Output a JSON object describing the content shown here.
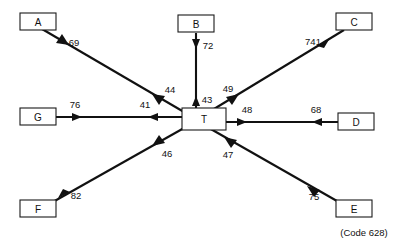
{
  "diagram": {
    "type": "hub-and-spoke-flow",
    "center_node": {
      "id": "T",
      "label": "T"
    },
    "nodes": [
      {
        "id": "A",
        "label": "A"
      },
      {
        "id": "B",
        "label": "B"
      },
      {
        "id": "C",
        "label": "C"
      },
      {
        "id": "D",
        "label": "D"
      },
      {
        "id": "E",
        "label": "E"
      },
      {
        "id": "F",
        "label": "F"
      },
      {
        "id": "G",
        "label": "G"
      }
    ],
    "flows": [
      {
        "id": "a-in",
        "from": "A",
        "to": "T",
        "value": "69"
      },
      {
        "id": "a-out",
        "from": "T",
        "to": "A",
        "value": "44"
      },
      {
        "id": "b-in",
        "from": "B",
        "to": "T",
        "value": "72"
      },
      {
        "id": "b-out",
        "from": "T",
        "to": "B",
        "value": "43"
      },
      {
        "id": "c-in",
        "from": "C",
        "to": "T",
        "value": "741"
      },
      {
        "id": "c-out",
        "from": "T",
        "to": "C",
        "value": "49"
      },
      {
        "id": "d-in",
        "from": "D",
        "to": "T",
        "value": "68"
      },
      {
        "id": "d-out",
        "from": "T",
        "to": "D",
        "value": "48"
      },
      {
        "id": "e-in",
        "from": "E",
        "to": "T",
        "value": "75"
      },
      {
        "id": "e-out",
        "from": "T",
        "to": "E",
        "value": "47"
      },
      {
        "id": "f-in",
        "from": "F",
        "to": "T",
        "value": "82"
      },
      {
        "id": "f-out",
        "from": "T",
        "to": "F",
        "value": "46"
      },
      {
        "id": "g-in",
        "from": "G",
        "to": "T",
        "value": "76"
      },
      {
        "id": "g-out",
        "from": "T",
        "to": "G",
        "value": "41"
      }
    ],
    "footnote": "(Code 628)",
    "colors": {
      "stroke": "#111111",
      "box_fill": "#ffffff",
      "background": "#ffffff"
    }
  }
}
